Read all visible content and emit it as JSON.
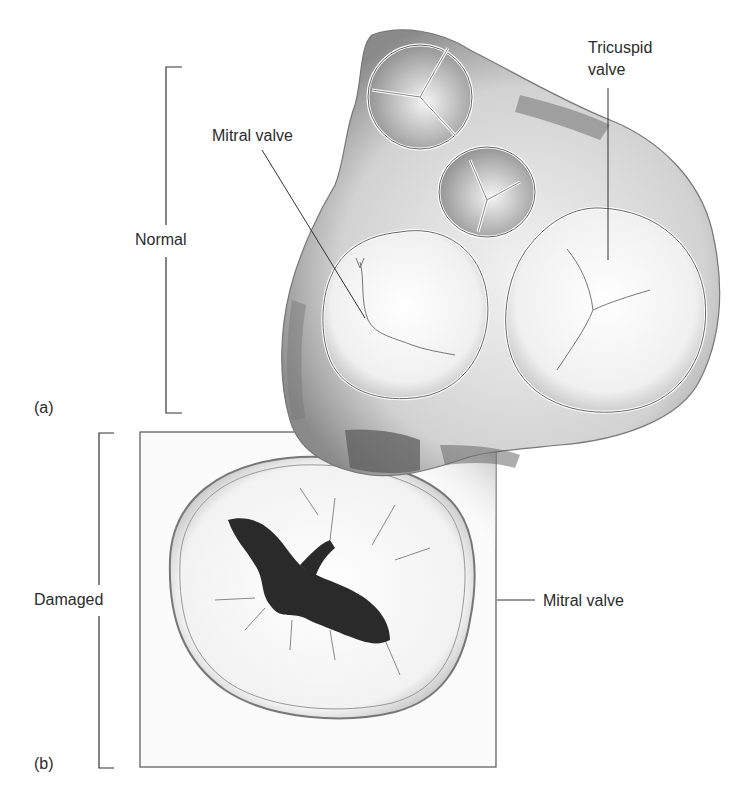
{
  "figure": {
    "panels": [
      {
        "id": "a",
        "panel_label": "(a)",
        "group_label": "Normal",
        "callouts": [
          {
            "label": "Mitral valve"
          },
          {
            "label_line1": "Tricuspid",
            "label_line2": "valve"
          }
        ]
      },
      {
        "id": "b",
        "panel_label": "(b)",
        "group_label": "Damaged",
        "callouts": [
          {
            "label": "Mitral valve"
          }
        ]
      }
    ],
    "colors": {
      "ink": "#2b2b2b",
      "tissue_light": "#e6e6e6",
      "tissue_mid": "#bdbdbd",
      "tissue_dark": "#6f6f6f",
      "orifice_dark": "#2a2a2a",
      "background": "#ffffff"
    }
  }
}
